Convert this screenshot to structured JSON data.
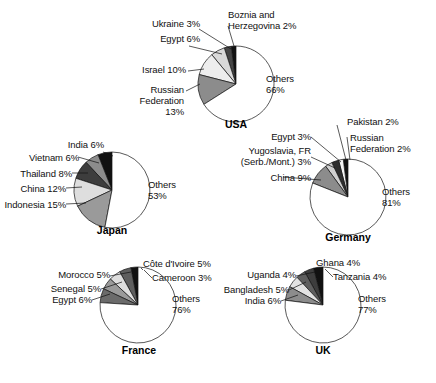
{
  "figure": {
    "width": 436,
    "height": 383,
    "background": "#ffffff",
    "line_color": "#111111",
    "text_color": "#111111"
  },
  "chart_data": [
    {
      "type": "pie",
      "title": "USA",
      "id": "usa",
      "center": [
        236,
        84
      ],
      "radius": 38,
      "start_angle_deg": 90,
      "direction": "counterclockwise",
      "labels": [
        "Boznia and\nHerzegovina 2%",
        "Ukraine 3%",
        "Egypt 6%",
        "Israel 10%",
        "Russian\nFederation\n13%",
        "Others\n66%"
      ],
      "categories": [
        "Boznia and Herzegovina",
        "Ukraine",
        "Egypt",
        "Israel",
        "Russian Federation",
        "Others"
      ],
      "values": [
        2,
        3,
        6,
        10,
        13,
        66
      ],
      "colors": [
        "#111111",
        "#454545",
        "#d9d9d9",
        "#ededed",
        "#8c8c8c",
        "#ffffff"
      ]
    },
    {
      "type": "pie",
      "title": "Japan",
      "id": "japan",
      "center": [
        112,
        190
      ],
      "radius": 38,
      "start_angle_deg": 90,
      "direction": "counterclockwise",
      "labels": [
        "India 6%",
        "Vietnam 6%",
        "Thailand 8%",
        "China 12%",
        "Indonesia 15%",
        "Others\n53%"
      ],
      "categories": [
        "India",
        "Vietnam",
        "Thailand",
        "China",
        "Indonesia",
        "Others"
      ],
      "values": [
        6,
        6,
        8,
        12,
        15,
        53
      ],
      "colors": [
        "#111111",
        "#8c8c8c",
        "#3d3d3d",
        "#dedede",
        "#9a9a9a",
        "#ffffff"
      ]
    },
    {
      "type": "pie",
      "title": "Germany",
      "id": "germany",
      "center": [
        348,
        197
      ],
      "radius": 38,
      "start_angle_deg": 90,
      "direction": "counterclockwise",
      "labels": [
        "Russian\nFederation 2%",
        "Pakistan 2%",
        "Egypt 3%",
        "Yugoslavia, FR\n(Serb./Mont.) 3%",
        "China 9%",
        "Others\n81%"
      ],
      "categories": [
        "Russian Federation",
        "Pakistan",
        "Egypt",
        "Yugoslavia, FR (Serb./Mont.)",
        "China",
        "Others"
      ],
      "values": [
        2,
        2,
        3,
        3,
        9,
        81
      ],
      "colors": [
        "#111111",
        "#f2f2f2",
        "#2e2e2e",
        "#d0d0d0",
        "#8c8c8c",
        "#ffffff"
      ]
    },
    {
      "type": "pie",
      "title": "France",
      "id": "france",
      "center": [
        138,
        305
      ],
      "radius": 38,
      "start_angle_deg": 90,
      "direction": "counterclockwise",
      "labels": [
        "Cameroon 3%",
        "Côte d'Ivoire 5%",
        "Morocco 5%",
        "Senegal 5%",
        "Egypt 6%",
        "Others\n76%"
      ],
      "categories": [
        "Cameroon",
        "Côte d'Ivoire",
        "Morocco",
        "Senegal",
        "Egypt",
        "Others"
      ],
      "values": [
        3,
        5,
        5,
        5,
        6,
        76
      ],
      "colors": [
        "#111111",
        "#5e5e5e",
        "#dedede",
        "#9a9a9a",
        "#6b6b6b",
        "#ffffff"
      ]
    },
    {
      "type": "pie",
      "title": "UK",
      "id": "uk",
      "center": [
        323,
        305
      ],
      "radius": 38,
      "start_angle_deg": 90,
      "direction": "counterclockwise",
      "labels": [
        "Tanzania 4%",
        "Ghana 4%",
        "Uganda 4%",
        "Bangladesh 5%",
        "India 6%",
        "Others\n77%"
      ],
      "categories": [
        "Tanzania",
        "Ghana",
        "Uganda",
        "Bangladesh",
        "India",
        "Others"
      ],
      "values": [
        4,
        4,
        4,
        5,
        6,
        77
      ],
      "colors": [
        "#111111",
        "#3d3d3d",
        "#5e5e5e",
        "#e2e2e2",
        "#8c8c8c",
        "#ffffff"
      ]
    }
  ],
  "labels": {
    "usa": {
      "bosnia": "Boznia and\nHerzegovina 2%",
      "ukraine": "Ukraine 3%",
      "egypt": "Egypt 6%",
      "israel": "Israel 10%",
      "russia": "Russian\nFederation\n13%",
      "others": "Others\n66%",
      "title": "USA"
    },
    "japan": {
      "india": "India 6%",
      "vietnam": "Vietnam 6%",
      "thailand": "Thailand 8%",
      "china": "China 12%",
      "indonesia": "Indonesia 15%",
      "others": "Others\n53%",
      "title": "Japan"
    },
    "germany": {
      "russia": "Russian\nFederation 2%",
      "pakistan": "Pakistan 2%",
      "egypt": "Egypt 3%",
      "yugoslavia": "Yugoslavia, FR\n(Serb./Mont.) 3%",
      "china": "China 9%",
      "others": "Others\n81%",
      "title": "Germany"
    },
    "france": {
      "cameroon": "Cameroon 3%",
      "ivory": "Côte d'Ivoire 5%",
      "morocco": "Morocco 5%",
      "senegal": "Senegal 5%",
      "egypt": "Egypt 6%",
      "others": "Others\n76%",
      "title": "France"
    },
    "uk": {
      "tanzania": "Tanzania 4%",
      "ghana": "Ghana 4%",
      "uganda": "Uganda 4%",
      "bangladesh": "Bangladesh 5%",
      "india": "India 6%",
      "others": "Others\n77%",
      "title": "UK"
    }
  }
}
